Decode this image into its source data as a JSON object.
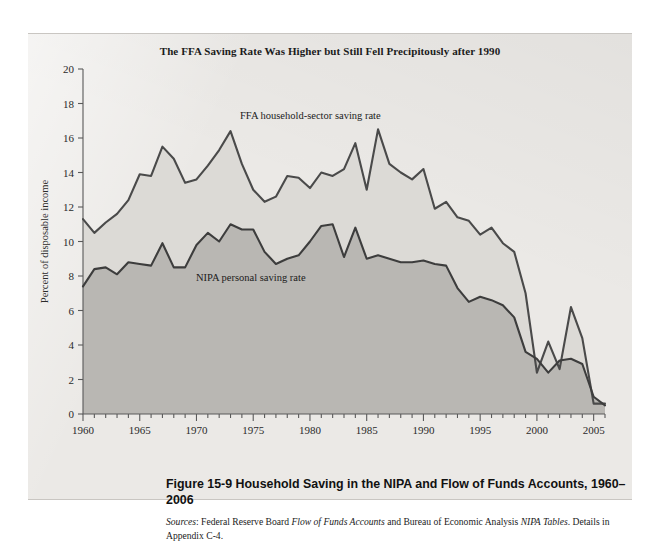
{
  "figure": {
    "panel_bg": "#ebe9e6",
    "chart_title": "The FFA Saving Rate Was Higher but Still Fell Precipitously after 1990",
    "caption_number": "Figure 15-9",
    "caption_text": "Household Saving in the NIPA and Flow of Funds Accounts, 1960–2006",
    "sources_label": "Sources",
    "sources_text_1": ": Federal Reserve Board ",
    "sources_italic_1": "Flow of Funds Accounts",
    "sources_text_2": " and Bureau of Economic Analysis ",
    "sources_italic_2": "NIPA Tables",
    "sources_text_3": ". Details in Appendix C-4."
  },
  "chart_data": {
    "type": "area",
    "title": "The FFA Saving Rate Was Higher but Still Fell Precipitously after 1990",
    "xlabel": "",
    "ylabel": "Percent of disposable income",
    "xlim": [
      1960,
      2006
    ],
    "ylim": [
      0,
      20
    ],
    "grid": false,
    "legend_position": "inline-annotation",
    "xticks": [
      1960,
      1965,
      1970,
      1975,
      1980,
      1985,
      1990,
      1995,
      2000,
      2005
    ],
    "xtick_labels": [
      "1960",
      "1965",
      "1970",
      "1975",
      "1980",
      "1985",
      "1990",
      "1995",
      "2000",
      "2005"
    ],
    "minor_xtick_interval": 1,
    "yticks": [
      0,
      2,
      4,
      6,
      8,
      10,
      12,
      14,
      16,
      18,
      20
    ],
    "ytick_labels": [
      "0",
      "2",
      "4",
      "6",
      "8",
      "10",
      "12",
      "14",
      "16",
      "18",
      "20"
    ],
    "x": [
      1960,
      1961,
      1962,
      1963,
      1964,
      1965,
      1966,
      1967,
      1968,
      1969,
      1970,
      1971,
      1972,
      1973,
      1974,
      1975,
      1976,
      1977,
      1978,
      1979,
      1980,
      1981,
      1982,
      1983,
      1984,
      1985,
      1986,
      1987,
      1988,
      1989,
      1990,
      1991,
      1992,
      1993,
      1994,
      1995,
      1996,
      1997,
      1998,
      1999,
      2000,
      2001,
      2002,
      2003,
      2004,
      2005,
      2006
    ],
    "series": [
      {
        "name": "FFA household-sector saving rate",
        "label": "FFA household-sector saving rate",
        "color": "#4a4a4a",
        "fill": "#dcdad6",
        "values": [
          11.3,
          10.5,
          11.1,
          11.6,
          12.4,
          13.9,
          13.8,
          15.5,
          14.8,
          13.4,
          13.6,
          14.4,
          15.3,
          16.4,
          14.5,
          13.0,
          12.3,
          12.6,
          13.8,
          13.7,
          13.1,
          14.0,
          13.8,
          14.2,
          15.7,
          13.0,
          16.5,
          14.5,
          14.0,
          13.6,
          14.2,
          11.9,
          12.3,
          11.4,
          11.2,
          10.4,
          10.8,
          9.9,
          9.4,
          7.0,
          2.4,
          4.2,
          2.6,
          6.2,
          4.4,
          0.6,
          0.6
        ]
      },
      {
        "name": "NIPA personal saving rate",
        "label": "NIPA personal saving rate",
        "color": "#3d3d3d",
        "fill": "#b9b7b3",
        "values": [
          7.4,
          8.4,
          8.5,
          8.1,
          8.8,
          8.7,
          8.6,
          9.9,
          8.5,
          8.5,
          9.8,
          10.5,
          10.0,
          11.0,
          10.7,
          10.7,
          9.4,
          8.7,
          9.0,
          9.2,
          10.0,
          10.9,
          11.0,
          9.1,
          10.8,
          9.0,
          9.2,
          9.0,
          8.8,
          8.8,
          8.9,
          8.7,
          8.6,
          7.3,
          6.5,
          6.8,
          6.6,
          6.3,
          5.6,
          3.6,
          3.2,
          2.4,
          3.1,
          3.2,
          2.9,
          1.0,
          0.5
        ]
      }
    ]
  }
}
